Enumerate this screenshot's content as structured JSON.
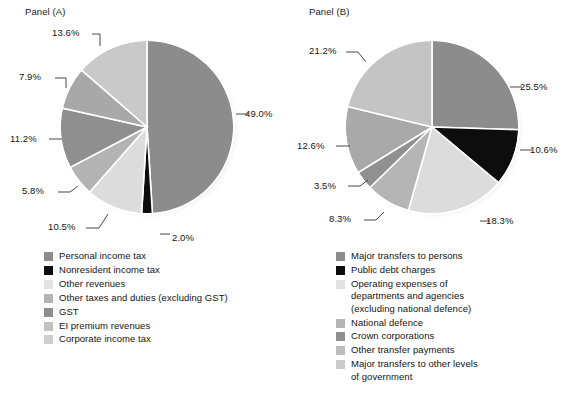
{
  "chart_data": [
    {
      "type": "pie",
      "title": "Panel (A)",
      "panel_id": "A",
      "categories": [
        "Personal income tax",
        "Nonresident income tax",
        "Other revenues",
        "Other taxes and duties (excluding GST)",
        "GST",
        "EI premium revenues",
        "Corporate income tax"
      ],
      "values": [
        49.0,
        2.0,
        10.5,
        5.8,
        11.2,
        7.9,
        13.6
      ],
      "labels": [
        "49.0%",
        "2.0%",
        "10.5%",
        "5.8%",
        "11.2%",
        "7.9%",
        "13.6%"
      ],
      "colors": [
        "#8c8c8c",
        "#0d0d0d",
        "#dcdcdc",
        "#b3b3b3",
        "#8f8f8f",
        "#a8a8a8",
        "#c9c9c9"
      ],
      "legend_position": "bottom-left",
      "grid": false,
      "xlabel": "",
      "ylabel": ""
    },
    {
      "type": "pie",
      "title": "Panel (B)",
      "panel_id": "B",
      "categories": [
        "Major transfers to persons",
        "Public debt charges",
        "Operating expenses of\ndepartments and agencies\n(excluding national defence)",
        "National defence",
        "Crown corporations",
        "Other transfer payments",
        "Major transfers to other levels\nof government"
      ],
      "values": [
        25.5,
        10.6,
        18.3,
        8.3,
        3.5,
        12.6,
        21.2
      ],
      "labels": [
        "25.5%",
        "10.6%",
        "18.3%",
        "8.3%",
        "3.5%",
        "12.6%",
        "21.2%"
      ],
      "colors": [
        "#8c8c8c",
        "#0d0d0d",
        "#dcdcdc",
        "#b5b5b5",
        "#909090",
        "#a9a9a9",
        "#c4c4c4"
      ],
      "legend_position": "bottom-left",
      "grid": false,
      "xlabel": "",
      "ylabel": ""
    }
  ],
  "panel_a": {
    "title": "Panel (A)",
    "pct_labels": [
      {
        "text": "13.6%",
        "x": 52,
        "y": 27
      },
      {
        "text": "7.9%",
        "x": 19,
        "y": 71
      },
      {
        "text": "11.2%",
        "x": 10,
        "y": 133
      },
      {
        "text": "5.8%",
        "x": 22,
        "y": 185
      },
      {
        "text": "10.5%",
        "x": 48,
        "y": 221
      },
      {
        "text": "2.0%",
        "x": 172,
        "y": 232
      },
      {
        "text": "49.0%",
        "x": 245,
        "y": 108
      }
    ],
    "legend": [
      {
        "label": "Personal income tax",
        "color": "#8c8c8c"
      },
      {
        "label": "Nonresident income tax",
        "color": "#0d0d0d"
      },
      {
        "label": "Other revenues",
        "color": "#e2e2e2"
      },
      {
        "label": "Other taxes and duties (excluding GST)",
        "color": "#b3b3b3"
      },
      {
        "label": "GST",
        "color": "#8f8f8f"
      },
      {
        "label": "EI premium revenues",
        "color": "#c2c2c2"
      },
      {
        "label": "Corporate income tax",
        "color": "#cfcfcf"
      }
    ]
  },
  "panel_b": {
    "title": "Panel (B)",
    "pct_labels": [
      {
        "text": "21.2%",
        "x": 17,
        "y": 45
      },
      {
        "text": "12.6%",
        "x": 5,
        "y": 140
      },
      {
        "text": "3.5%",
        "x": 22,
        "y": 180
      },
      {
        "text": "8.3%",
        "x": 37,
        "y": 213
      },
      {
        "text": "18.3%",
        "x": 194,
        "y": 215
      },
      {
        "text": "10.6%",
        "x": 238,
        "y": 144
      },
      {
        "text": "25.5%",
        "x": 228,
        "y": 81
      }
    ],
    "legend": [
      {
        "label": "Major transfers to persons",
        "color": "#8c8c8c"
      },
      {
        "label": "Public debt charges",
        "color": "#0d0d0d"
      },
      {
        "label": "Operating expenses of\ndepartments and agencies\n(excluding national defence)",
        "color": "#e2e2e2"
      },
      {
        "label": "National defence",
        "color": "#b5b5b5"
      },
      {
        "label": "Crown corporations",
        "color": "#909090"
      },
      {
        "label": "Other transfer payments",
        "color": "#bdbdbd"
      },
      {
        "label": "Major transfers to other levels\nof government",
        "color": "#cbcbcb"
      }
    ]
  }
}
